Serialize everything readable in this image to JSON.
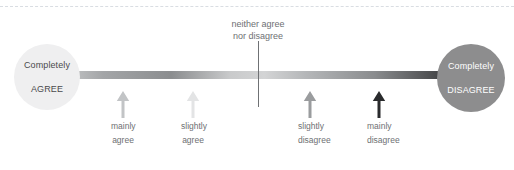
{
  "diagram": {
    "background_color": "#ffffff",
    "top_rule": {
      "name": "dashed-separator",
      "color": "#d9dde2",
      "style": "dashed"
    },
    "spectrum": {
      "name": "agree-disagree-gradient-bar",
      "gradient_stops": [
        {
          "position": "0%",
          "color": "#d7d8d9"
        },
        {
          "position": "14%",
          "color": "#a3a5a7"
        },
        {
          "position": "30%",
          "color": "#8b8d8f"
        },
        {
          "position": "44%",
          "color": "#c9cacb"
        },
        {
          "position": "52%",
          "color": "#d3d4d5"
        },
        {
          "position": "62%",
          "color": "#b4b6b8"
        },
        {
          "position": "78%",
          "color": "#8a8c8e"
        },
        {
          "position": "92%",
          "color": "#4b4c4e"
        },
        {
          "position": "100%",
          "color": "#17181a"
        }
      ]
    },
    "endpoints": [
      {
        "id": "completely-agree",
        "line1": "Completely",
        "line2": "AGREE",
        "circle_color": "#efeff0",
        "text_color": "#4a4a4c"
      },
      {
        "id": "completely-disagree",
        "line1": "Completely",
        "line2": "DISAGREE",
        "circle_color": "#8d8d8e",
        "text_color": "#ffffff"
      }
    ],
    "midpoint": {
      "line1": "neither agree",
      "line2": "nor disagree",
      "text_color": "#6e7073",
      "tick_color": "#6f7174"
    },
    "markers": [
      {
        "id": "mainly-agree",
        "line1": "mainly",
        "line2": "agree",
        "arrow_color": "#c2c4c6",
        "label_color": "#6e7073"
      },
      {
        "id": "slightly-agree",
        "line1": "slightly",
        "line2": "agree",
        "arrow_color": "#e3e4e5",
        "label_color": "#6e7073"
      },
      {
        "id": "slightly-disagree",
        "line1": "slightly",
        "line2": "disagree",
        "arrow_color": "#9a9c9e",
        "label_color": "#6e7073"
      },
      {
        "id": "mainly-disagree",
        "line1": "mainly",
        "line2": "disagree",
        "arrow_color": "#2a2b2d",
        "label_color": "#6e7073"
      }
    ]
  }
}
